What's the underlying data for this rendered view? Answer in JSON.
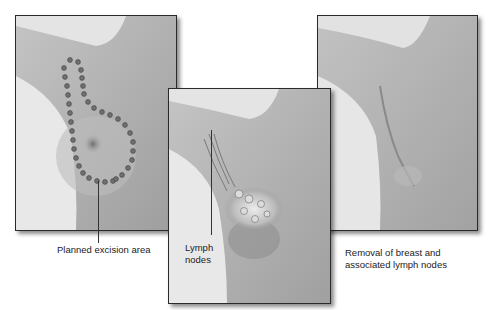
{
  "figure": {
    "panels": [
      {
        "id": "before",
        "description": "Torso with dotted outline of planned excision around breast and axilla"
      },
      {
        "id": "lymph",
        "description": "Breast tissue and axillary lymph nodes highlighted"
      },
      {
        "id": "after",
        "description": "Chest after removal of breast and associated lymph nodes with scar"
      }
    ],
    "captions": {
      "planned": "Planned excision area",
      "lymph_line1": "Lymph",
      "lymph_line2": "nodes",
      "removal_line1": "Removal of breast and",
      "removal_line2": "associated lymph nodes"
    },
    "colors": {
      "background": "#ffffff",
      "skin_light": "#cfcfcf",
      "skin_mid": "#b3b3b3",
      "skin_dark": "#8e8e8e",
      "dots": "#6a6a6a",
      "border": "#2a2a2a"
    }
  }
}
